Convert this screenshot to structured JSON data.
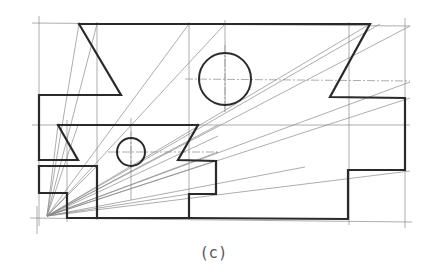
{
  "figure": {
    "caption": "(c)",
    "colors": {
      "object_line": "#2a2a2a",
      "construction_line": "#8a8a8a",
      "background": "#ffffff"
    }
  },
  "outline": {
    "upper_block": "79,24 370,24 330,97 405,98 405,170 348,170 348,219 189,218",
    "upper_left_notch": "79,24 121,95 39,95 39,160",
    "middle_band_top": "58,125 198,125",
    "middle_left_notch": "58,125 78,160 39,160",
    "middle_right_notch": "198,125 178,160 216,161 216,194 189,194 189,218",
    "lower_left_block": "39,166 97,166 97,218",
    "lower_left_step": "39,166 39,193 67,193 67,218 189,218"
  },
  "circles": [
    {
      "name": "large-circle",
      "cx": 225,
      "cy": 79,
      "r": 26
    },
    {
      "name": "small-circle",
      "cx": 131,
      "cy": 152,
      "r": 14
    }
  ],
  "construction": {
    "origin": {
      "x": 47,
      "y": 216
    },
    "grid_verticals": [
      39,
      67,
      97,
      131,
      189,
      225,
      349,
      405
    ],
    "grid_horizontals": [
      24,
      79,
      95,
      125,
      152,
      160,
      166,
      193,
      218
    ]
  }
}
